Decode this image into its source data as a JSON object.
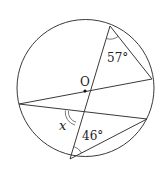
{
  "diagram": {
    "type": "circle-geometry",
    "circle": {
      "cx": 85.5,
      "cy": 88,
      "r": 68.5
    },
    "center_label": "O",
    "points": {
      "A": {
        "x": 110,
        "y": 26
      },
      "B": {
        "x": 152,
        "y": 79
      },
      "C": {
        "x": 19,
        "y": 104
      },
      "D": {
        "x": 147,
        "y": 119
      },
      "E": {
        "x": 70,
        "y": 159
      },
      "O": {
        "x": 85,
        "y": 91
      }
    },
    "segments": [
      "A-E",
      "A-B",
      "C-B",
      "C-D",
      "E-D"
    ],
    "angles": [
      {
        "label": "57°",
        "vertex": "A",
        "description": "angle at top point between diameter and chord to right point"
      },
      {
        "label": "46°",
        "vertex": "E",
        "description": "angle at bottom point between diameter and chord to lower-right point"
      },
      {
        "label": "x",
        "vertex": "intersection",
        "description": "unknown angle at intersection of diameter and lower chord (double arc)"
      }
    ]
  },
  "labels": {
    "O": "O",
    "angle57": "57°",
    "angle46": "46°",
    "x": "x"
  }
}
